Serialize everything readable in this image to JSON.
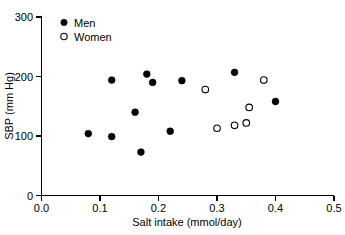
{
  "chart_data": {
    "type": "scatter",
    "title": "",
    "xlabel": "Salt intake (mmol/day)",
    "ylabel": "SBP (mm Hg)",
    "xlim": [
      0.0,
      0.5
    ],
    "ylim": [
      0,
      300
    ],
    "xticks": [
      "0.0",
      "0.1",
      "0.2",
      "0.3",
      "0.4",
      "0.5"
    ],
    "xtick_values": [
      0.0,
      0.1,
      0.2,
      0.3,
      0.4,
      0.5
    ],
    "yticks": [
      "0",
      "100",
      "200",
      "300"
    ],
    "ytick_values": [
      0,
      100,
      200,
      300
    ],
    "grid": false,
    "legend_position": "top-left-inside",
    "series": [
      {
        "name": "Men",
        "marker": "filled-circle",
        "color": "#000000",
        "points": [
          {
            "x": 0.08,
            "y": 104
          },
          {
            "x": 0.12,
            "y": 194
          },
          {
            "x": 0.12,
            "y": 99
          },
          {
            "x": 0.16,
            "y": 140
          },
          {
            "x": 0.17,
            "y": 73
          },
          {
            "x": 0.18,
            "y": 204
          },
          {
            "x": 0.19,
            "y": 190
          },
          {
            "x": 0.22,
            "y": 108
          },
          {
            "x": 0.24,
            "y": 193
          },
          {
            "x": 0.33,
            "y": 207
          },
          {
            "x": 0.4,
            "y": 158
          }
        ]
      },
      {
        "name": "Women",
        "marker": "open-circle",
        "color": "#000000",
        "points": [
          {
            "x": 0.28,
            "y": 178
          },
          {
            "x": 0.3,
            "y": 113
          },
          {
            "x": 0.33,
            "y": 118
          },
          {
            "x": 0.35,
            "y": 122
          },
          {
            "x": 0.355,
            "y": 148
          },
          {
            "x": 0.38,
            "y": 194
          }
        ]
      }
    ]
  },
  "legend": {
    "entries": [
      {
        "label": "Men",
        "marker": "filled-circle"
      },
      {
        "label": "Women",
        "marker": "open-circle"
      }
    ]
  },
  "axes": {
    "x_title": "Salt intake (mmol/day)",
    "y_title": "SBP (mm Hg)"
  }
}
